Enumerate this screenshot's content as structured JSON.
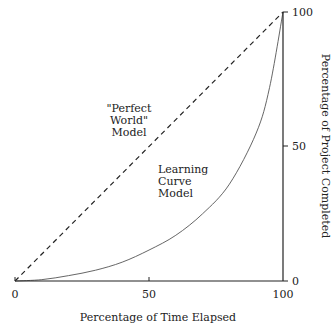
{
  "chart_data": {
    "type": "line",
    "title": "",
    "xlabel": "Percentage of Time Elapsed",
    "ylabel": "Percentage of Project Completed",
    "xlim": [
      0,
      100
    ],
    "ylim": [
      0,
      100
    ],
    "x_ticks": [
      "0",
      "50",
      "100"
    ],
    "y_ticks": [
      "0",
      "50",
      "100"
    ],
    "y_axis_position": "right",
    "grid": false,
    "legend": "none (inline annotations)",
    "series": [
      {
        "name": "\"Perfect World\" Model",
        "style": "dashed",
        "x": [
          0,
          100
        ],
        "y": [
          0,
          100
        ]
      },
      {
        "name": "Learning Curve Model",
        "style": "solid",
        "x": [
          0,
          10,
          20,
          30,
          40,
          50,
          60,
          70,
          80,
          90,
          95,
          100
        ],
        "y": [
          0,
          0.5,
          2,
          4,
          7,
          11.5,
          17,
          25,
          36,
          55,
          72,
          100
        ]
      }
    ],
    "annotations": [
      {
        "text": [
          "\"Perfect",
          "World\"",
          "Model"
        ],
        "x": 38,
        "y": 60
      },
      {
        "text": [
          "Learning",
          "Curve",
          "Model"
        ],
        "x": 62,
        "y": 32
      }
    ]
  }
}
